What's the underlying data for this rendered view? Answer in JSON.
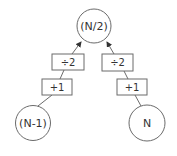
{
  "diagram": {
    "title": "",
    "colors": {
      "stroke": "#6b6b6b",
      "text": "#333333",
      "background": "#ffffff"
    },
    "nodes": {
      "top": {
        "label": "(N/2)"
      },
      "left": {
        "label": "(N-1)"
      },
      "right": {
        "label": "N"
      }
    },
    "operations": {
      "left_divide": {
        "label": "÷2"
      },
      "left_add": {
        "label": "+1"
      },
      "right_divide": {
        "label": "÷2"
      },
      "right_add": {
        "label": "+1"
      }
    },
    "edges": [
      {
        "from": "left",
        "to": "left_add"
      },
      {
        "from": "left_add",
        "to": "left_divide"
      },
      {
        "from": "left_divide",
        "to": "top",
        "arrow": true
      },
      {
        "from": "right",
        "to": "right_add"
      },
      {
        "from": "right_add",
        "to": "right_divide"
      },
      {
        "from": "right_divide",
        "to": "top",
        "arrow": true
      }
    ]
  }
}
